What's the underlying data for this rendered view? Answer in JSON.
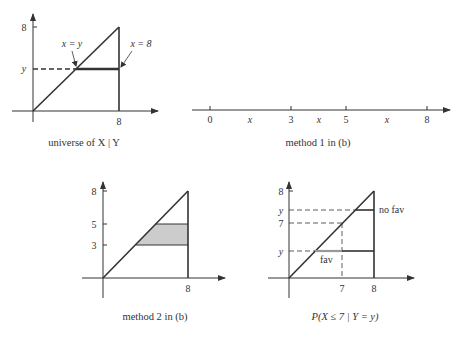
{
  "panels": {
    "universe": {
      "caption": "universe of X | Y",
      "y_ticks": [
        "8",
        "y"
      ],
      "x_ticks": [
        "8"
      ],
      "annotations": [
        "x = y",
        "x = 8"
      ]
    },
    "method1": {
      "caption": "method 1 in (b)",
      "ticks": [
        "0",
        "3",
        "5",
        "8"
      ],
      "interval_labels": [
        "x",
        "x",
        "x"
      ]
    },
    "method2": {
      "caption": "method 2 in (b)",
      "y_ticks": [
        "8",
        "5",
        "3"
      ],
      "x_ticks": [
        "8"
      ]
    },
    "prob": {
      "caption": "P(X ≤ 7 | Y = y)",
      "y_ticks": [
        "8",
        "y",
        "7",
        "y"
      ],
      "x_ticks": [
        "7",
        "8"
      ],
      "labels": [
        "no fav",
        "fav"
      ]
    }
  },
  "colors": {
    "line": "#333333",
    "shade": "#cccccc"
  }
}
